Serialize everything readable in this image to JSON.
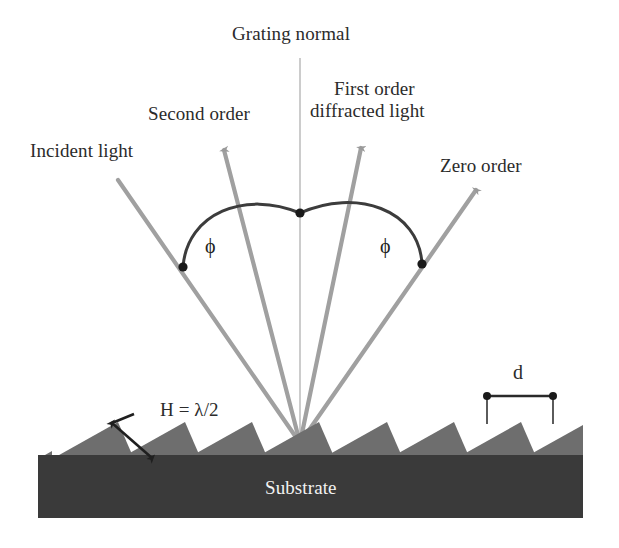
{
  "figure": {
    "type": "optical-diagram",
    "background_color": "#ffffff"
  },
  "labels": {
    "grating_normal": "Grating normal",
    "second_order": "Second order",
    "first_order": "First order\ndiffracted light",
    "first_order_line1": "First order",
    "first_order_line2": "diffracted light",
    "incident_light": "Incident light",
    "zero_order": "Zero order",
    "phi_left": "ϕ",
    "phi_right": "ϕ",
    "groove_height": "H = λ/2",
    "groove_spacing": "d",
    "substrate": "Substrate"
  },
  "colors": {
    "ray": "#9a9a9a",
    "normal_line": "#b0b0b0",
    "arc": "#3c3c3c",
    "substrate_fill": "#3a3a3a",
    "groove_fill": "#6b6b6b",
    "groove_fill_dark": "#565656",
    "text": "#2b2b2b",
    "text_on_substrate": "#f2f2f2",
    "marker_dot": "#1a1a1a"
  },
  "geometry": {
    "convergence_point": {
      "x": 300,
      "y": 443
    },
    "normal_line": {
      "x": 300,
      "y_top": 58,
      "y_bottom": 443
    },
    "rays": [
      {
        "name": "incident-light",
        "x1": 118,
        "y1": 180,
        "x2": 300,
        "y2": 443,
        "arrow": false
      },
      {
        "name": "second-order",
        "x1": 300,
        "y1": 443,
        "x2": 222,
        "y2": 142,
        "arrow": true
      },
      {
        "name": "first-order",
        "x1": 300,
        "y1": 443,
        "x2": 362,
        "y2": 140,
        "arrow": true
      },
      {
        "name": "zero-order",
        "x1": 300,
        "y1": 443,
        "x2": 480,
        "y2": 183,
        "arrow": true
      }
    ],
    "angle_arcs": [
      {
        "name": "phi-left-arc",
        "from": {
          "x": 183,
          "y": 267
        },
        "apex": {
          "x": 300,
          "y": 213
        },
        "label_at": {
          "x": 210,
          "y": 245
        }
      },
      {
        "name": "phi-right-arc",
        "from": {
          "x": 300,
          "y": 213
        },
        "to": {
          "x": 422,
          "y": 264
        },
        "label_at": {
          "x": 385,
          "y": 245
        }
      }
    ],
    "arc_dots": [
      {
        "x": 183,
        "y": 267
      },
      {
        "x": 300,
        "y": 213
      },
      {
        "x": 422,
        "y": 264
      }
    ],
    "substrate_bar": {
      "x": 38,
      "y": 455,
      "width": 545,
      "height": 63
    },
    "groove_peaks_x": [
      118,
      185,
      252,
      319,
      387,
      454,
      521
    ],
    "groove_peak_y": 422,
    "groove_base_y": 458,
    "spacing_marker": {
      "left_x": 487,
      "right_x": 553,
      "bar_y": 396,
      "peak_y": 424
    },
    "height_marker": {
      "x1": 110,
      "y1": 421,
      "x2": 152,
      "y2": 456
    }
  }
}
